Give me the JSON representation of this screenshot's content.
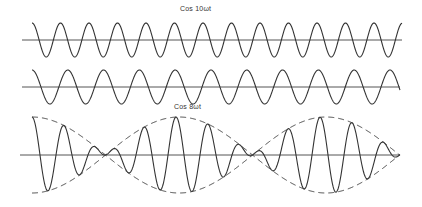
{
  "figure": {
    "top_label": "Cos 10ωt",
    "middle_label": "Cos 8ωt",
    "waves": [
      {
        "name": "cos-10wt",
        "axis_y": 40,
        "amplitude": 17,
        "x_start": 32,
        "x_end": 402,
        "period": 28.5,
        "phase": 0,
        "style": "solid"
      },
      {
        "name": "cos-8wt",
        "axis_y": 87,
        "amplitude": 17,
        "x_start": 32,
        "x_end": 400,
        "period": 35.8,
        "phase": 0,
        "style": "solid"
      },
      {
        "name": "sum-beat",
        "axis_y": 155,
        "amplitude": 38,
        "x_start": 32,
        "x_end": 400,
        "carrier_period": 32,
        "envelope_period": 294,
        "style": "solid"
      }
    ],
    "axes": [
      {
        "name": "top-axis",
        "y": 40,
        "x1": 22,
        "x2": 402
      },
      {
        "name": "middle-axis",
        "y": 87,
        "x1": 22,
        "x2": 400
      },
      {
        "name": "bottom-axis",
        "y": 155,
        "x1": 20,
        "x2": 400
      }
    ],
    "envelope": {
      "style": "dashed",
      "nodes_x": [
        105,
        253,
        400
      ],
      "max_x": [
        32,
        180,
        326
      ]
    },
    "colors": {
      "line": "#333333",
      "axis": "#555555",
      "background": "#ffffff"
    }
  }
}
